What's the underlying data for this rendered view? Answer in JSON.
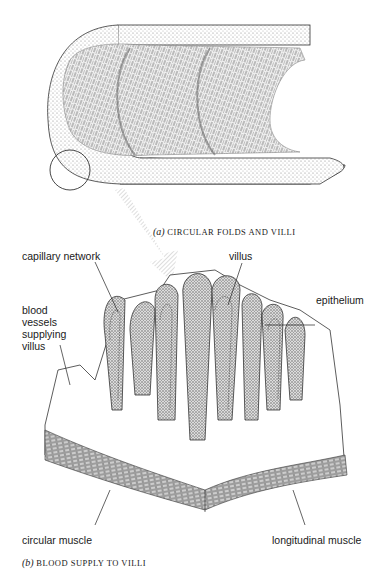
{
  "figure_a": {
    "caption_prefix": "(a)",
    "caption": "CIRCULAR FOLDS AND VILLI"
  },
  "figure_b": {
    "caption_prefix": "(b)",
    "caption": "BLOOD SUPPLY TO VILLI",
    "labels": {
      "capillary_network": "capillary network",
      "villus": "villus",
      "epithelium": "epithelium",
      "blood_vessels": [
        "blood",
        "vessels",
        "supplying",
        "villus"
      ],
      "circular_muscle": "circular muscle",
      "longitudinal_muscle": "longitudinal muscle"
    }
  }
}
